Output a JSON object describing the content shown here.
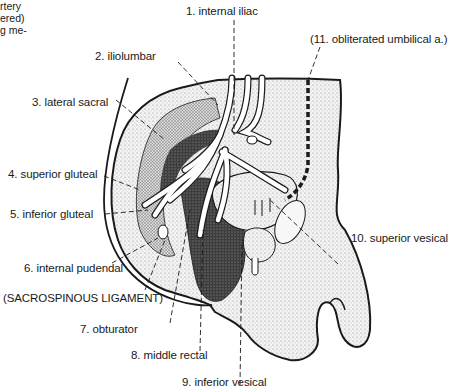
{
  "caption_fragment": [
    "rtery",
    "ered)",
    "g me-"
  ],
  "labels": {
    "internal_iliac": "1. internal iliac",
    "iliolumbar": "2. iliolumbar",
    "lateral_sacral": "3. lateral sacral",
    "superior_gluteal": "4. superior gluteal",
    "inferior_gluteal": "5. inferior gluteal",
    "internal_pudendal": "6. internal pudendal",
    "sacrospinous_ligament": "(SACROSPINOUS LIGAMENT)",
    "obturator": "7. obturator",
    "middle_rectal": "8. middle rectal",
    "inferior_vesical": "9. inferior vesical",
    "superior_vesical": "10. superior vesical",
    "obliterated_umbilical": "(11. obliterated umbilical a.)"
  },
  "colors": {
    "ink": "#1a1a1a",
    "stipple_light": "#e4e4e4",
    "stipple_mid": "#bdbdbd",
    "stipple_dark": "#3a3a3a",
    "vessel": "#ffffff"
  }
}
